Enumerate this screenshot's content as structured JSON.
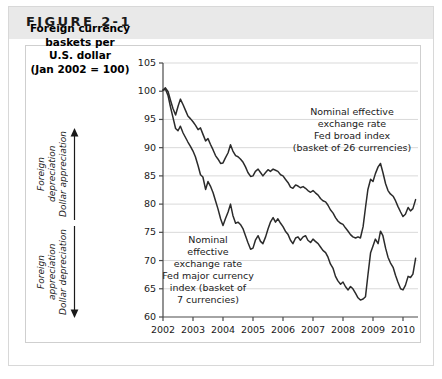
{
  "figure": {
    "label": "FIGURE 2-1"
  },
  "axis_title": {
    "line1": "Foreign currency",
    "line2": "baskets per",
    "line3": "U.S. dollar",
    "line4": "(Jan 2002 = 100)"
  },
  "direction_annotations": {
    "up": {
      "line1": "Foreign",
      "line2": "depreciation",
      "line3": "Dollar appreciation",
      "arrow": "up-arrow-icon"
    },
    "down": {
      "line1": "Foreign",
      "line2": "appreciation",
      "line3": "Dollar depreciation",
      "arrow": "down-arrow-icon"
    }
  },
  "chart_data": {
    "type": "line",
    "title": "Foreign currency baskets per U.S. dollar (Jan 2002 = 100)",
    "xlabel": "",
    "ylabel": "Foreign currency baskets per U.S. dollar (Jan 2002 = 100)",
    "xlim": [
      2002.0,
      2010.5
    ],
    "ylim": [
      60,
      105
    ],
    "yticks": [
      60,
      65,
      70,
      75,
      80,
      85,
      90,
      95,
      100,
      105
    ],
    "xticks": [
      2002,
      2003,
      2004,
      2005,
      2006,
      2007,
      2008,
      2009,
      2010
    ],
    "xtick_labels": [
      "2002",
      "2003",
      "2004",
      "2005",
      "2006",
      "2007",
      "2008",
      "2009",
      "2010"
    ],
    "ytick_labels": [
      "60",
      "65",
      "70",
      "75",
      "80",
      "85",
      "90",
      "95",
      "100",
      "105"
    ],
    "grid": true,
    "grid_axis": "y",
    "legend": "annotations-inline",
    "line_color": "#2b2b2b",
    "grid_color": "#d9d9d9",
    "axis_color": "#4a4a4a",
    "annotations": [
      {
        "name": "broad-index-annotation",
        "lines": [
          "Nominal effective",
          "exchange rate",
          "Fed broad index",
          "(basket of 26 currencies)"
        ],
        "series": "Fed broad index"
      },
      {
        "name": "major-index-annotation",
        "lines": [
          "Nominal",
          "effective",
          "exchange rate",
          "Fed major currency",
          "index (basket of",
          "7 currencies)"
        ],
        "series": "Fed major currency index"
      }
    ],
    "series": [
      {
        "name": "Fed broad index",
        "label": "Nominal effective exchange rate Fed broad index (basket of 26 currencies)",
        "x": [
          2002.0,
          2002.08,
          2002.17,
          2002.25,
          2002.33,
          2002.42,
          2002.5,
          2002.58,
          2002.67,
          2002.75,
          2002.83,
          2002.92,
          2003.0,
          2003.08,
          2003.17,
          2003.25,
          2003.33,
          2003.42,
          2003.5,
          2003.58,
          2003.67,
          2003.75,
          2003.83,
          2003.92,
          2004.0,
          2004.08,
          2004.17,
          2004.25,
          2004.33,
          2004.42,
          2004.5,
          2004.58,
          2004.67,
          2004.75,
          2004.83,
          2004.92,
          2005.0,
          2005.08,
          2005.17,
          2005.25,
          2005.33,
          2005.42,
          2005.5,
          2005.58,
          2005.67,
          2005.75,
          2005.83,
          2005.92,
          2006.0,
          2006.08,
          2006.17,
          2006.25,
          2006.33,
          2006.42,
          2006.5,
          2006.58,
          2006.67,
          2006.75,
          2006.83,
          2006.92,
          2007.0,
          2007.08,
          2007.17,
          2007.25,
          2007.33,
          2007.42,
          2007.5,
          2007.58,
          2007.67,
          2007.75,
          2007.83,
          2007.92,
          2008.0,
          2008.08,
          2008.17,
          2008.25,
          2008.33,
          2008.42,
          2008.5,
          2008.58,
          2008.67,
          2008.75,
          2008.83,
          2008.92,
          2009.0,
          2009.08,
          2009.17,
          2009.25,
          2009.33,
          2009.42,
          2009.5,
          2009.58,
          2009.67,
          2009.75,
          2009.83,
          2009.92,
          2010.0,
          2010.08,
          2010.17,
          2010.25,
          2010.33,
          2010.42
        ],
        "values": [
          100.2,
          100.6,
          99.9,
          98.4,
          97.0,
          95.8,
          97.3,
          98.6,
          97.6,
          96.6,
          95.6,
          95.1,
          94.6,
          94.0,
          93.2,
          93.5,
          92.4,
          91.2,
          91.6,
          90.6,
          89.6,
          88.6,
          88.0,
          87.2,
          87.3,
          88.2,
          89.1,
          90.5,
          89.4,
          88.6,
          88.4,
          88.0,
          87.4,
          86.6,
          85.6,
          84.9,
          85.0,
          85.8,
          86.2,
          85.6,
          85.0,
          85.6,
          86.1,
          85.8,
          86.2,
          86.0,
          85.8,
          85.2,
          85.0,
          84.4,
          83.8,
          83.0,
          82.8,
          83.4,
          83.2,
          82.9,
          83.1,
          82.8,
          82.4,
          82.1,
          82.4,
          82.0,
          81.6,
          81.0,
          80.6,
          80.4,
          79.8,
          79.0,
          78.4,
          77.6,
          77.0,
          76.6,
          76.4,
          75.8,
          75.2,
          74.6,
          74.2,
          74.0,
          74.2,
          74.0,
          76.0,
          79.4,
          82.6,
          84.4,
          84.0,
          85.4,
          86.6,
          87.2,
          85.6,
          83.6,
          82.4,
          81.8,
          81.4,
          80.6,
          79.6,
          78.6,
          77.8,
          78.2,
          79.4,
          78.8,
          79.2,
          80.8
        ]
      },
      {
        "name": "Fed major currency index",
        "label": "Nominal effective exchange rate Fed major currency index (basket of 7 currencies)",
        "x": [
          2002.0,
          2002.08,
          2002.17,
          2002.25,
          2002.33,
          2002.42,
          2002.5,
          2002.58,
          2002.67,
          2002.75,
          2002.83,
          2002.92,
          2003.0,
          2003.08,
          2003.17,
          2003.25,
          2003.33,
          2003.42,
          2003.5,
          2003.58,
          2003.67,
          2003.75,
          2003.83,
          2003.92,
          2004.0,
          2004.08,
          2004.17,
          2004.25,
          2004.33,
          2004.42,
          2004.5,
          2004.58,
          2004.67,
          2004.75,
          2004.83,
          2004.92,
          2005.0,
          2005.08,
          2005.17,
          2005.25,
          2005.33,
          2005.42,
          2005.5,
          2005.58,
          2005.67,
          2005.75,
          2005.83,
          2005.92,
          2006.0,
          2006.08,
          2006.17,
          2006.25,
          2006.33,
          2006.42,
          2006.5,
          2006.58,
          2006.67,
          2006.75,
          2006.83,
          2006.92,
          2007.0,
          2007.08,
          2007.17,
          2007.25,
          2007.33,
          2007.42,
          2007.5,
          2007.58,
          2007.67,
          2007.75,
          2007.83,
          2007.92,
          2008.0,
          2008.08,
          2008.17,
          2008.25,
          2008.33,
          2008.42,
          2008.5,
          2008.58,
          2008.67,
          2008.75,
          2008.83,
          2008.92,
          2009.0,
          2009.08,
          2009.17,
          2009.25,
          2009.33,
          2009.42,
          2009.5,
          2009.58,
          2009.67,
          2009.75,
          2009.83,
          2009.92,
          2010.0,
          2010.08,
          2010.17,
          2010.25,
          2010.33,
          2010.42
        ],
        "values": [
          100.2,
          100.4,
          99.2,
          97.2,
          95.4,
          93.4,
          93.0,
          93.8,
          92.6,
          91.8,
          91.0,
          90.2,
          89.4,
          88.4,
          86.8,
          85.2,
          84.8,
          82.6,
          84.0,
          83.2,
          82.0,
          80.6,
          79.2,
          77.4,
          76.2,
          77.4,
          78.6,
          80.0,
          78.0,
          76.6,
          76.8,
          76.4,
          75.6,
          74.4,
          73.2,
          72.0,
          72.2,
          73.6,
          74.4,
          73.4,
          73.0,
          74.2,
          75.6,
          76.8,
          77.6,
          76.8,
          77.4,
          76.6,
          76.0,
          75.2,
          74.6,
          73.6,
          73.0,
          74.0,
          74.2,
          73.6,
          74.2,
          74.4,
          73.6,
          73.2,
          73.8,
          73.4,
          73.0,
          72.4,
          71.8,
          71.4,
          70.6,
          69.4,
          68.6,
          67.2,
          66.4,
          65.8,
          66.2,
          65.4,
          64.8,
          65.4,
          65.0,
          64.2,
          63.4,
          63.0,
          63.2,
          63.6,
          67.4,
          71.4,
          72.6,
          73.8,
          73.0,
          75.2,
          74.4,
          72.2,
          70.6,
          69.6,
          68.8,
          67.4,
          66.2,
          65.0,
          64.8,
          65.6,
          67.2,
          67.0,
          67.6,
          70.4
        ]
      }
    ]
  }
}
